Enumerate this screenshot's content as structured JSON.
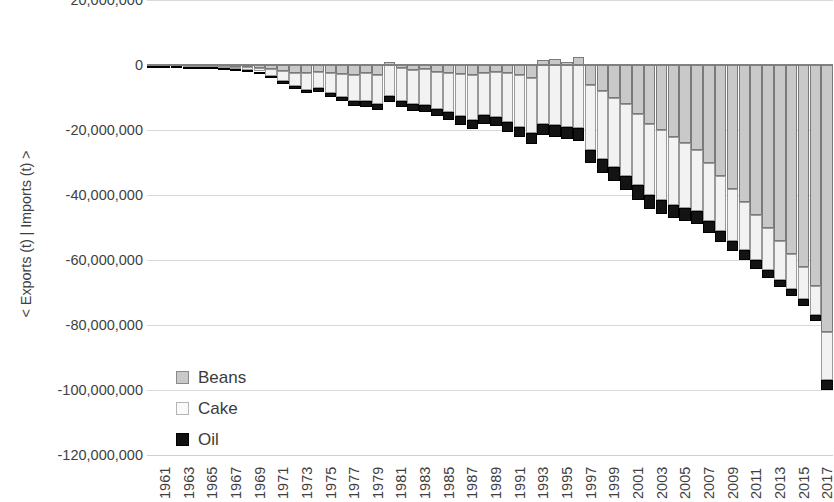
{
  "chart_data": {
    "type": "bar",
    "stacked": true,
    "title": "",
    "xlabel": "",
    "ylabel": "< Exports (t) | Imports (t) >",
    "ylim": [
      -120000000,
      20000000
    ],
    "ytick_labels": [
      "20,000,000",
      "0",
      "-20,000,000",
      "-40,000,000",
      "-60,000,000",
      "-80,000,000",
      "-100,000,000",
      "-120,000,000"
    ],
    "ytick_values": [
      20000000,
      0,
      -20000000,
      -40000000,
      -60000000,
      -80000000,
      -100000000,
      -120000000
    ],
    "grid": true,
    "legend_position": "inside-lower-left",
    "xtick_labels": [
      "1961",
      "1963",
      "1965",
      "1967",
      "1969",
      "1971",
      "1973",
      "1975",
      "1977",
      "1979",
      "1981",
      "1983",
      "1985",
      "1987",
      "1989",
      "1991",
      "1993",
      "1995",
      "1997",
      "1999",
      "2001",
      "2003",
      "2005",
      "2007",
      "2009",
      "2011",
      "2013",
      "2015",
      "2017"
    ],
    "categories": [
      1961,
      1962,
      1963,
      1964,
      1965,
      1966,
      1967,
      1968,
      1969,
      1970,
      1971,
      1972,
      1973,
      1974,
      1975,
      1976,
      1977,
      1978,
      1979,
      1980,
      1981,
      1982,
      1983,
      1984,
      1985,
      1986,
      1987,
      1988,
      1989,
      1990,
      1991,
      1992,
      1993,
      1994,
      1995,
      1996,
      1997,
      1998,
      1999,
      2000,
      2001,
      2002,
      2003,
      2004,
      2005,
      2006,
      2007,
      2008,
      2009,
      2010,
      2011,
      2012,
      2013,
      2014,
      2015,
      2016,
      2017,
      2018
    ],
    "colors": {
      "Beans": "#c9c9c9",
      "Cake": "#f2f2f2",
      "Oil": "#131313"
    },
    "series": [
      {
        "name": "Beans",
        "values": [
          -100000,
          -150000,
          -200000,
          -250000,
          -300000,
          -350000,
          -400000,
          -500000,
          -600000,
          -800000,
          -1200000,
          -1800000,
          -2400000,
          -2600000,
          -2000000,
          -2600000,
          -2800000,
          -3000000,
          -2600000,
          -3000000,
          1000000,
          -1000000,
          -1500000,
          -1200000,
          -2000000,
          -2500000,
          -2800000,
          -3000000,
          -2500000,
          -2000000,
          -2500000,
          -3000000,
          -4000000,
          1500000,
          2000000,
          1000000,
          2500000,
          -6000000,
          -8000000,
          -10000000,
          -12000000,
          -15000000,
          -18000000,
          -20000000,
          -22000000,
          -24000000,
          -26000000,
          -30000000,
          -34000000,
          -38000000,
          -42000000,
          -46000000,
          -50000000,
          -54000000,
          -58000000,
          -62000000,
          -68000000,
          -82000000
        ]
      },
      {
        "name": "Cake",
        "values": [
          -100000,
          -150000,
          -200000,
          -250000,
          -300000,
          -400000,
          -500000,
          -700000,
          -900000,
          -1200000,
          -2200000,
          -3200000,
          -4200000,
          -5000000,
          -5200000,
          -6000000,
          -7000000,
          -8000000,
          -8500000,
          -9000000,
          -9500000,
          -10000000,
          -10500000,
          -11000000,
          -11500000,
          -12000000,
          -13000000,
          -14000000,
          -13000000,
          -14000000,
          -15000000,
          -16000000,
          -17000000,
          -18000000,
          -18500000,
          -19000000,
          -19500000,
          -20000000,
          -21000000,
          -21500000,
          -22000000,
          -22000000,
          -22000000,
          -21500000,
          -21000000,
          -20000000,
          -19000000,
          -18000000,
          -17000000,
          -16000000,
          -15000000,
          -14000000,
          -13000000,
          -12000000,
          -11000000,
          -10000000,
          -9000000,
          -15000000
        ]
      },
      {
        "name": "Oil",
        "values": [
          -50000,
          -60000,
          -80000,
          -100000,
          -120000,
          -150000,
          -180000,
          -220000,
          -260000,
          -320000,
          -500000,
          -700000,
          -900000,
          -1100000,
          -1100000,
          -1200000,
          -1400000,
          -1600000,
          -1700000,
          -1800000,
          -1900000,
          -2000000,
          -2100000,
          -2200000,
          -2300000,
          -2400000,
          -2600000,
          -2800000,
          -2600000,
          -2800000,
          -3000000,
          -3200000,
          -3400000,
          -3600000,
          -3700000,
          -3800000,
          -3900000,
          -4000000,
          -4200000,
          -4300000,
          -4400000,
          -4400000,
          -4400000,
          -4300000,
          -4200000,
          -4000000,
          -3800000,
          -3600000,
          -3400000,
          -3200000,
          -3000000,
          -2800000,
          -2600000,
          -2400000,
          -2200000,
          -2000000,
          -1800000,
          -3000000
        ]
      }
    ]
  },
  "legend": {
    "items": [
      {
        "label": "Beans",
        "key": "beans"
      },
      {
        "label": "Cake",
        "key": "cake"
      },
      {
        "label": "Oil",
        "key": "oil"
      }
    ]
  },
  "axes": {
    "y_title": "< Exports (t) | Imports (t) >"
  }
}
